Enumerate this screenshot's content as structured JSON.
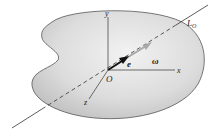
{
  "diagram": {
    "labels": {
      "axis_y": "y",
      "axis_x": "x",
      "axis_z": "z",
      "origin": "O",
      "unit_vector": "e",
      "angular_velocity": "ω",
      "line_name": "L",
      "line_subscript": "O"
    },
    "colors": {
      "body_fill": "#d9d9d9",
      "body_stroke": "#555555",
      "axes": "#333333",
      "e_arrow": "#111111",
      "omega_arrow": "#a8a8a8"
    }
  }
}
